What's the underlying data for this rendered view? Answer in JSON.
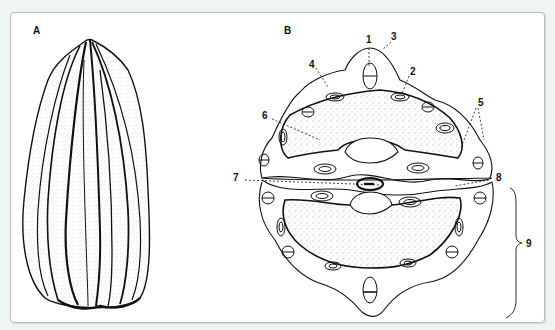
{
  "figure": {
    "panels": [
      {
        "id": "A",
        "label": "A",
        "description": "whole fruit, external view"
      },
      {
        "id": "B",
        "label": "B",
        "description": "transverse section"
      }
    ],
    "callouts": [
      {
        "n": "1",
        "label": "1"
      },
      {
        "n": "2",
        "label": "2"
      },
      {
        "n": "3",
        "label": "3"
      },
      {
        "n": "4",
        "label": "4"
      },
      {
        "n": "5",
        "label": "5"
      },
      {
        "n": "6",
        "label": "6"
      },
      {
        "n": "7",
        "label": "7"
      },
      {
        "n": "8",
        "label": "8"
      },
      {
        "n": "9",
        "label": "9"
      }
    ]
  },
  "colors": {
    "background": "#eef5f5",
    "panel": "#ffffff",
    "ink": "#111111",
    "border": "#b8bcbc"
  }
}
